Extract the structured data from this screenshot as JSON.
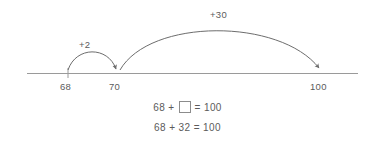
{
  "diagram": {
    "type": "number-line-jump-strategy",
    "background_color": "#ffffff",
    "line_color": "#9a9a9a",
    "arc_color": "#6d6d6d",
    "text_color": "#5b5b5b",
    "number_line": {
      "start_x": 27,
      "end_x": 358,
      "y": 73
    },
    "ticks": [
      {
        "label": "68",
        "x": 68
      },
      {
        "label": "70",
        "x": 117
      },
      {
        "label": "100",
        "x": 321
      }
    ],
    "jumps": [
      {
        "label": "+2",
        "from_x": 68,
        "to_x": 117,
        "apex_y": 52,
        "label_x": 87,
        "label_y": 45
      },
      {
        "label": "+30",
        "from_x": 119,
        "to_x": 321,
        "apex_y": 25,
        "label_x": 221,
        "label_y": 15
      }
    ]
  },
  "equations": [
    {
      "name": "unknown-addend-equation",
      "left": "68 +",
      "has_answer_box": true,
      "box_value": "",
      "right": "= 100"
    },
    {
      "name": "solved-equation",
      "left": "68 + 32 = 100",
      "has_answer_box": false,
      "box_value": "",
      "right": ""
    }
  ]
}
